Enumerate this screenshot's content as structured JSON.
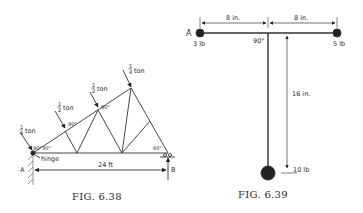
{
  "figures": [
    {
      "caption": "FIG. 6.38",
      "description": "Roof truss with hinge at A and roller at B",
      "loads": [
        {
          "num": "1",
          "den": "4",
          "unit": "ton"
        },
        {
          "num": "1",
          "den": "2",
          "unit": "ton"
        },
        {
          "num": "1",
          "den": "2",
          "unit": "ton"
        },
        {
          "num": "1",
          "den": "4",
          "unit": "ton"
        }
      ],
      "angles": {
        "load_angle": "90°",
        "base_left": "30°",
        "base_right": "60°"
      },
      "labels": {
        "hinge": "hinge",
        "support_a": "A",
        "support_b": "B",
        "span": "24 ft"
      }
    },
    {
      "caption": "FIG. 6.39",
      "description": "T-shaped rigid body with three masses",
      "dimensions": {
        "left": "8 in.",
        "right": "8 in.",
        "vertical": "16 in."
      },
      "angle": "90°",
      "point": "A",
      "masses": {
        "left": "3 lb",
        "right": "5 lb",
        "bottom": "10 lb"
      }
    }
  ]
}
